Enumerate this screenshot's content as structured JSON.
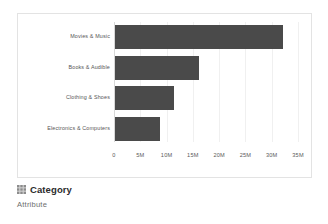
{
  "chart_data": {
    "type": "bar",
    "orientation": "horizontal",
    "title": "",
    "xlabel": "",
    "ylabel": "",
    "categories": [
      "Movies & Music",
      "Books & Audible",
      "Clothing & Shoes",
      "Electronics & Computers"
    ],
    "values": [
      32000000,
      16000000,
      11200000,
      8500000
    ],
    "xlim": [
      0,
      35000000
    ],
    "xticks": [
      0,
      5000000,
      10000000,
      15000000,
      20000000,
      25000000,
      30000000,
      35000000
    ],
    "xtick_labels": [
      "0",
      "5M",
      "10M",
      "15M",
      "20M",
      "25M",
      "30M",
      "35M"
    ],
    "grid": true,
    "legend": false,
    "bar_color": "#4a4a4a"
  },
  "caption": {
    "icon": "grid-icon",
    "title": "Category",
    "subtitle": "Attribute"
  },
  "colors": {
    "bar": "#4a4a4a",
    "panel_border": "#e3e3e3",
    "gridline": "#f0f0f0",
    "axis": "#d8d8d8",
    "tick_text": "#5a5a5a",
    "label_text": "#555555",
    "title_text": "#2b2b2b",
    "subtitle_text": "#6e6e6e"
  }
}
